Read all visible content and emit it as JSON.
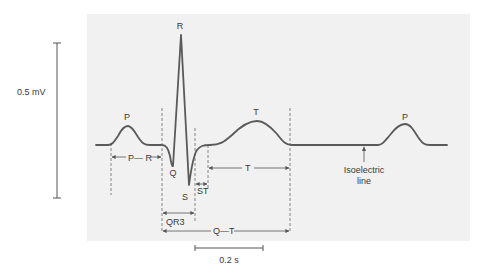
{
  "figure": {
    "background_color": "#ffffff",
    "panel_color": "#f1f1f1",
    "trace_color": "#5a5a5a"
  },
  "waves": {
    "p1": "P",
    "q": "Q",
    "r": "R",
    "s": "S",
    "t": "T",
    "p2": "P"
  },
  "intervals": {
    "pr": "P— R",
    "qrs": "QR3",
    "st": "ST",
    "t": "T",
    "qt": "Q—T"
  },
  "annotations": {
    "isoelectric_line1": "Isoelectric",
    "isoelectric_line2": "line"
  },
  "scales": {
    "voltage": "0.5 mV",
    "time": "0.2 s"
  }
}
